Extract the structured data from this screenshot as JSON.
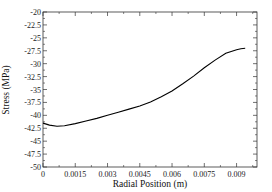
{
  "chart_data": {
    "type": "line",
    "title": "",
    "xlabel": "Radial Position (m)",
    "ylabel": "Stress (MPa)",
    "xlim": [
      0,
      0.00995
    ],
    "ylim": [
      -50,
      -20
    ],
    "x_ticks": [
      0,
      0.0015,
      0.003,
      0.0045,
      0.006,
      0.0075,
      0.009
    ],
    "x_tick_labels": [
      "0",
      "0.0015",
      "0.003",
      "0.0045",
      "0.006",
      "0.0075",
      "0.009"
    ],
    "y_ticks": [
      -20,
      -22.5,
      -25,
      -27.5,
      -30,
      -32.5,
      -35,
      -37.5,
      -40,
      -42.5,
      -45,
      -47.5,
      -50
    ],
    "y_tick_labels": [
      "-20",
      "-22.5",
      "-25",
      "-27.5",
      "-30",
      "-32.5",
      "-35",
      "-37.5",
      "-40",
      "-42.5",
      "-45",
      "-47.5",
      "-50"
    ],
    "grid": false,
    "legend": null,
    "series": [
      {
        "name": "Stress",
        "color": "#000000",
        "x": [
          0,
          0.0003,
          0.00065,
          0.001,
          0.0015,
          0.002,
          0.0025,
          0.003,
          0.0035,
          0.004,
          0.0045,
          0.005,
          0.0055,
          0.006,
          0.0065,
          0.007,
          0.0075,
          0.008,
          0.0085,
          0.009,
          0.0092,
          0.0094
        ],
        "y": [
          -41.5,
          -41.9,
          -42.1,
          -42.0,
          -41.6,
          -41.1,
          -40.6,
          -40.0,
          -39.4,
          -38.8,
          -38.2,
          -37.4,
          -36.4,
          -35.3,
          -33.9,
          -32.4,
          -30.8,
          -29.3,
          -28.0,
          -27.3,
          -27.1,
          -27.0
        ]
      }
    ]
  },
  "plot": {
    "left": 43,
    "top": 12,
    "right": 257,
    "bottom": 167
  }
}
